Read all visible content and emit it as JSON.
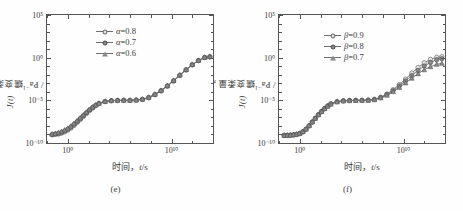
{
  "figure": {
    "background": "#fefefe",
    "axis_color": "#555555",
    "marker_colors": {
      "open_circle": "#e2e2e2",
      "filled_circle": "#8a8a8a",
      "triangle": "#8a8a8a",
      "line": "#6e6e6e"
    }
  },
  "panels": [
    {
      "id": "panel-e",
      "caption": "(e)",
      "chart_data": {
        "type": "line",
        "title": "",
        "subtitle": "",
        "xlabel": "时间，t/s",
        "ylabel": "蠕变柔量，J(t) / Pa⁻¹",
        "xlabel_parts": {
          "cn": "时间，",
          "var": "t",
          "unit": "/s"
        },
        "ylabel_parts": {
          "cn": "蠕变柔量，",
          "var": "J(t)",
          "unit": " / Pa⁻¹"
        },
        "xscale": "log",
        "yscale": "log",
        "xlim": [
          -2,
          14
        ],
        "ylim": [
          -10,
          5
        ],
        "grid": false,
        "legend_position": "upper-center",
        "xticks": [
          0,
          10
        ],
        "xtick_labels": [
          "10⁰",
          "10¹⁰"
        ],
        "yticks": [
          5,
          0,
          -5,
          -10
        ],
        "ytick_labels": [
          "10⁵",
          "10⁰",
          "10⁻⁵",
          "10⁻¹⁰"
        ],
        "x_log": [
          -1.5,
          -1.2,
          -0.9,
          -0.6,
          -0.3,
          0.0,
          0.3,
          0.6,
          0.9,
          1.2,
          1.5,
          1.8,
          2.1,
          2.4,
          2.7,
          3.0,
          3.6,
          4.2,
          4.8,
          5.4,
          6.0,
          6.6,
          7.2,
          7.8,
          8.4,
          9.0,
          9.6,
          10.2,
          10.8,
          11.4,
          12.0,
          12.6,
          13.2,
          13.7
        ],
        "series": [
          {
            "name": "α=0.8",
            "symbol": "open-circle",
            "param": "α",
            "value": "0.8",
            "y_log": [
              -9.05,
              -9.0,
              -8.95,
              -8.85,
              -8.7,
              -8.5,
              -8.25,
              -7.95,
              -7.6,
              -7.25,
              -6.9,
              -6.55,
              -6.2,
              -5.9,
              -5.62,
              -5.4,
              -5.15,
              -5.05,
              -5.02,
              -5.0,
              -5.0,
              -4.98,
              -4.9,
              -4.7,
              -4.35,
              -3.9,
              -3.35,
              -2.75,
              -2.1,
              -1.45,
              -0.85,
              -0.35,
              0.02,
              0.1
            ]
          },
          {
            "name": "α=0.7",
            "symbol": "filled-circle",
            "param": "α",
            "value": "0.7",
            "y_log": [
              -9.0,
              -8.95,
              -8.88,
              -8.76,
              -8.6,
              -8.4,
              -8.14,
              -7.84,
              -7.5,
              -7.15,
              -6.8,
              -6.46,
              -6.12,
              -5.84,
              -5.58,
              -5.36,
              -5.13,
              -5.04,
              -5.01,
              -5.0,
              -5.0,
              -4.97,
              -4.88,
              -4.67,
              -4.32,
              -3.86,
              -3.31,
              -2.71,
              -2.06,
              -1.42,
              -0.82,
              -0.33,
              0.03,
              0.11
            ]
          },
          {
            "name": "α=0.6",
            "symbol": "triangle",
            "param": "α",
            "value": "0.6",
            "y_log": [
              -8.95,
              -8.88,
              -8.78,
              -8.64,
              -8.46,
              -8.26,
              -8.0,
              -7.7,
              -7.38,
              -7.04,
              -6.7,
              -6.38,
              -6.05,
              -5.78,
              -5.54,
              -5.33,
              -5.11,
              -5.03,
              -5.0,
              -5.0,
              -4.99,
              -4.96,
              -4.86,
              -4.64,
              -4.28,
              -3.82,
              -3.27,
              -2.67,
              -2.02,
              -1.39,
              -0.8,
              -0.31,
              0.04,
              0.12
            ]
          }
        ]
      }
    },
    {
      "id": "panel-f",
      "caption": "(f)",
      "chart_data": {
        "type": "line",
        "title": "",
        "subtitle": "",
        "xlabel": "时间，t/s",
        "ylabel": "蠕变柔量，J(t) / Pa⁻¹",
        "xlabel_parts": {
          "cn": "时间，",
          "var": "t",
          "unit": "/s"
        },
        "ylabel_parts": {
          "cn": "蠕变柔量，",
          "var": "J(t)",
          "unit": " / Pa⁻¹"
        },
        "xscale": "log",
        "yscale": "log",
        "xlim": [
          -2,
          14
        ],
        "ylim": [
          -10,
          5
        ],
        "grid": false,
        "legend_position": "upper-center",
        "xticks": [
          0,
          10
        ],
        "xtick_labels": [
          "10⁰",
          "10¹⁰"
        ],
        "yticks": [
          5,
          0,
          -5,
          -10
        ],
        "ytick_labels": [
          "10⁵",
          "10⁰",
          "10⁻⁵",
          "10⁻¹⁰"
        ],
        "x_log": [
          -1.5,
          -1.2,
          -0.9,
          -0.6,
          -0.3,
          0.0,
          0.3,
          0.6,
          0.9,
          1.2,
          1.5,
          1.8,
          2.1,
          2.4,
          2.7,
          3.0,
          3.6,
          4.2,
          4.8,
          5.4,
          6.0,
          6.6,
          7.2,
          7.8,
          8.4,
          9.0,
          9.6,
          10.2,
          10.8,
          11.4,
          12.0,
          12.6,
          13.2,
          13.7
        ],
        "series": [
          {
            "name": "β=0.9",
            "symbol": "open-circle",
            "param": "β",
            "value": "0.9",
            "y_log": [
              -9.1,
              -9.1,
              -9.08,
              -9.05,
              -9.0,
              -8.9,
              -8.7,
              -8.4,
              -8.0,
              -7.55,
              -7.1,
              -6.68,
              -6.3,
              -5.95,
              -5.65,
              -5.4,
              -5.15,
              -5.05,
              -5.01,
              -5.0,
              -5.0,
              -4.97,
              -4.88,
              -4.64,
              -4.25,
              -3.75,
              -3.15,
              -2.5,
              -1.8,
              -1.15,
              -0.6,
              -0.2,
              0.05,
              0.12
            ]
          },
          {
            "name": "β=0.8",
            "symbol": "filled-circle",
            "param": "β",
            "value": "0.8",
            "y_log": [
              -9.1,
              -9.1,
              -9.08,
              -9.04,
              -8.98,
              -8.88,
              -8.68,
              -8.38,
              -7.98,
              -7.54,
              -7.1,
              -6.68,
              -6.3,
              -5.96,
              -5.66,
              -5.42,
              -5.16,
              -5.06,
              -5.02,
              -5.0,
              -5.0,
              -4.98,
              -4.9,
              -4.68,
              -4.32,
              -3.86,
              -3.3,
              -2.72,
              -2.1,
              -1.5,
              -0.98,
              -0.56,
              -0.25,
              -0.12
            ]
          },
          {
            "name": "β=0.7",
            "symbol": "triangle",
            "param": "β",
            "value": "0.7",
            "y_log": [
              -9.1,
              -9.09,
              -9.07,
              -9.03,
              -8.96,
              -8.86,
              -8.66,
              -8.36,
              -7.96,
              -7.52,
              -7.1,
              -6.69,
              -6.32,
              -5.98,
              -5.68,
              -5.44,
              -5.18,
              -5.07,
              -5.03,
              -5.01,
              -5.0,
              -4.99,
              -4.92,
              -4.72,
              -4.4,
              -3.98,
              -3.48,
              -2.95,
              -2.4,
              -1.88,
              -1.42,
              -1.05,
              -0.78,
              -0.66
            ]
          }
        ]
      }
    }
  ]
}
